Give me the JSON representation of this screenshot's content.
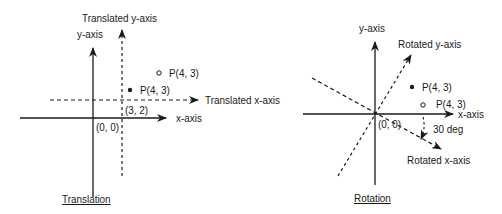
{
  "translation": {
    "caption": "Translation",
    "y_axis_label": "y-axis",
    "x_axis_label": "x-axis",
    "translated_y_axis_label": "Translated y-axis",
    "translated_x_axis_label": "Translated x-axis",
    "origin_label": "(0, 0)",
    "new_origin_label": "(3, 2)",
    "point_filled_label": "P(4, 3)",
    "point_open_label": "P(4, 3)"
  },
  "rotation": {
    "caption": "Rotation",
    "y_axis_label": "y-axis",
    "x_axis_label": "x-axis",
    "rotated_y_axis_label": "Rotated y-axis",
    "rotated_x_axis_label": "Rotated x-axis",
    "origin_label": "(0, 0)",
    "angle_label": "30 deg",
    "point_filled_label": "P(4, 3)",
    "point_open_label": "P(4, 3)"
  },
  "colors": {
    "ink": "#1a1a1a",
    "background": "#ffffff"
  }
}
